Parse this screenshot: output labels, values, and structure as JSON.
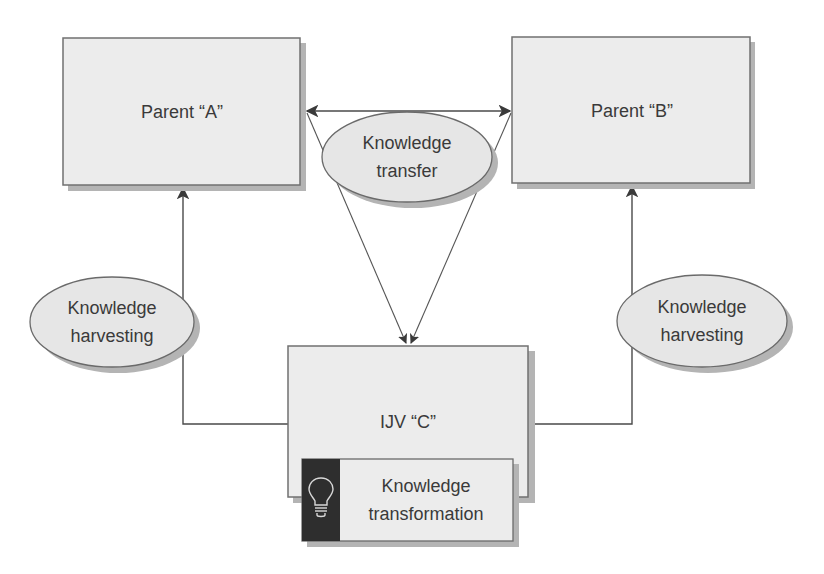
{
  "diagram": {
    "type": "knowledge-flow",
    "nodes": {
      "parent_a": {
        "label": "Parent “A”"
      },
      "parent_b": {
        "label": "Parent “B”"
      },
      "ijv_c": {
        "label": "IJV “C”"
      }
    },
    "ovals": {
      "transfer": {
        "line1": "Knowledge",
        "line2": "transfer"
      },
      "harvest_left": {
        "line1": "Knowledge",
        "line2": "harvesting"
      },
      "harvest_right": {
        "line1": "Knowledge",
        "line2": "harvesting"
      }
    },
    "transformation": {
      "line1": "Knowledge",
      "line2": "transformation",
      "icon": "lightbulb-icon"
    },
    "edges": [
      {
        "from": "parent_a",
        "to": "parent_b",
        "label": "Knowledge transfer",
        "style": "double-arrow"
      },
      {
        "from": "parent_a",
        "to": "ijv_c",
        "style": "arrow"
      },
      {
        "from": "parent_b",
        "to": "ijv_c",
        "style": "arrow"
      },
      {
        "from": "ijv_c",
        "to": "parent_a",
        "label": "Knowledge harvesting",
        "style": "arrow"
      },
      {
        "from": "ijv_c",
        "to": "parent_b",
        "label": "Knowledge harvesting",
        "style": "arrow"
      }
    ],
    "colors": {
      "box_fill": "#ececec",
      "oval_fill": "#e6e6e6",
      "stroke": "#4a4a4a",
      "icon_panel": "#2e2e2e",
      "text": "#3a3a3a"
    }
  }
}
